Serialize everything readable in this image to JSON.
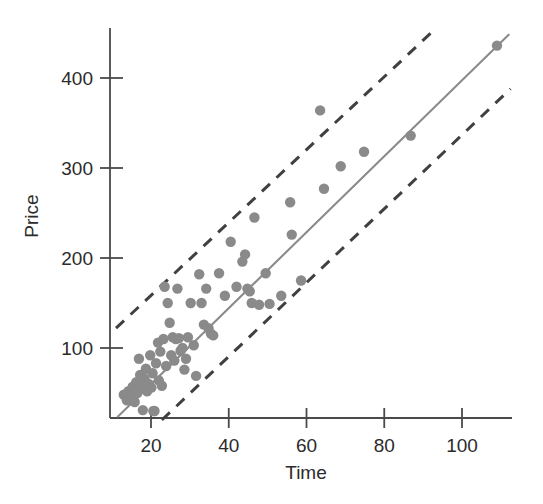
{
  "figure": {
    "title": "",
    "background_color": "#ffffff"
  },
  "chart_data": {
    "type": "scatter",
    "title": "",
    "subtitle": "",
    "xlabel": "Time",
    "ylabel": "Price",
    "xlim": [
      10,
      113
    ],
    "ylim": [
      18,
      455
    ],
    "grid": false,
    "legend": null,
    "legend_position": "none",
    "xticks": [
      20,
      40,
      60,
      80,
      100
    ],
    "xtick_labels": [
      "20",
      "40",
      "60",
      "80",
      "100"
    ],
    "yticks": [
      100,
      200,
      300,
      400
    ],
    "ytick_labels": [
      "100",
      "200",
      "300",
      "400"
    ],
    "point_color": "#8a8a8a",
    "fit_line_color": "#8b8b8b",
    "band_color": "#404040",
    "series": [
      {
        "name": "observations",
        "marker": "circle",
        "points": [
          [
            13.0,
            48
          ],
          [
            13.8,
            42
          ],
          [
            14.2,
            52
          ],
          [
            15.0,
            45
          ],
          [
            15.3,
            57
          ],
          [
            15.8,
            40
          ],
          [
            16.2,
            62
          ],
          [
            16.5,
            50
          ],
          [
            16.9,
            88
          ],
          [
            17.2,
            70
          ],
          [
            17.6,
            58
          ],
          [
            17.9,
            31
          ],
          [
            18.3,
            66
          ],
          [
            18.7,
            77
          ],
          [
            19.0,
            52
          ],
          [
            19.4,
            60
          ],
          [
            19.8,
            92
          ],
          [
            20.1,
            56
          ],
          [
            20.4,
            72
          ],
          [
            20.6,
            30
          ],
          [
            20.9,
            30
          ],
          [
            21.3,
            83
          ],
          [
            21.8,
            106
          ],
          [
            22.0,
            64
          ],
          [
            22.4,
            96
          ],
          [
            22.8,
            58
          ],
          [
            23.2,
            110
          ],
          [
            23.5,
            168
          ],
          [
            23.9,
            80
          ],
          [
            24.3,
            150
          ],
          [
            24.8,
            128
          ],
          [
            25.2,
            92
          ],
          [
            25.6,
            112
          ],
          [
            26.0,
            86
          ],
          [
            26.4,
            110
          ],
          [
            26.8,
            166
          ],
          [
            27.2,
            111
          ],
          [
            27.6,
            97
          ],
          [
            28.1,
            100
          ],
          [
            28.6,
            76
          ],
          [
            29.0,
            88
          ],
          [
            29.5,
            112
          ],
          [
            30.2,
            150
          ],
          [
            31.0,
            103
          ],
          [
            31.6,
            69
          ],
          [
            32.4,
            182
          ],
          [
            33.0,
            150
          ],
          [
            33.6,
            126
          ],
          [
            34.2,
            166
          ],
          [
            34.8,
            122
          ],
          [
            35.4,
            116
          ],
          [
            36.0,
            114
          ],
          [
            37.5,
            183
          ],
          [
            39.0,
            158
          ],
          [
            40.5,
            218
          ],
          [
            42.0,
            168
          ],
          [
            43.5,
            196
          ],
          [
            44.2,
            204
          ],
          [
            44.8,
            166
          ],
          [
            45.4,
            163
          ],
          [
            45.9,
            150
          ],
          [
            46.6,
            245
          ],
          [
            47.8,
            148
          ],
          [
            49.5,
            183
          ],
          [
            50.5,
            149
          ],
          [
            53.5,
            158
          ],
          [
            55.8,
            262
          ],
          [
            56.2,
            226
          ],
          [
            58.6,
            175
          ],
          [
            63.5,
            364
          ],
          [
            64.5,
            277
          ],
          [
            68.8,
            302
          ],
          [
            74.8,
            318
          ],
          [
            86.8,
            336
          ],
          [
            109.0,
            436
          ]
        ]
      }
    ],
    "fit_line": {
      "name": "least-squares-fit",
      "style": "solid",
      "x_start": 11.5,
      "y_start": 24,
      "x_end": 112.0,
      "y_end": 448
    },
    "prediction_bands": [
      {
        "name": "upper-prediction-band",
        "style": "dashed",
        "x_start": 11.0,
        "y_start": 122,
        "x_end": 92.5,
        "y_end": 452
      },
      {
        "name": "lower-prediction-band",
        "style": "dashed",
        "x_start": 22.8,
        "y_start": 20,
        "x_end": 112.5,
        "y_end": 388
      }
    ]
  }
}
